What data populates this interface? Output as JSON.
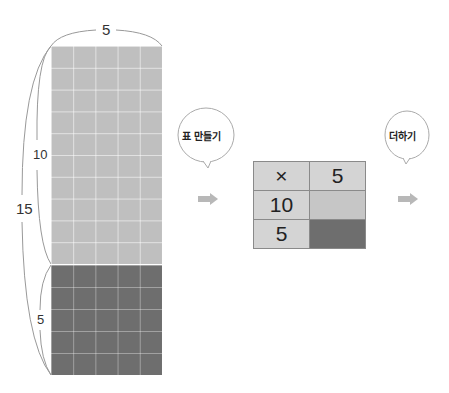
{
  "area_model": {
    "top_width_label": "5",
    "upper_height_label": "10",
    "total_height_label": "15",
    "lower_height_label": "5",
    "upper_rows": 10,
    "lower_rows": 5,
    "columns": 5,
    "colors": {
      "upper": "#bfbfbf",
      "lower": "#6e6e6e"
    }
  },
  "steps": [
    {
      "bubble": "표 만들기"
    },
    {
      "bubble": "더하기"
    }
  ],
  "table": {
    "header": [
      "×",
      "5"
    ],
    "rows": [
      {
        "label": "10",
        "value": ""
      },
      {
        "label": "5",
        "value": ""
      }
    ]
  },
  "arrow_color": "#b8b8b8"
}
